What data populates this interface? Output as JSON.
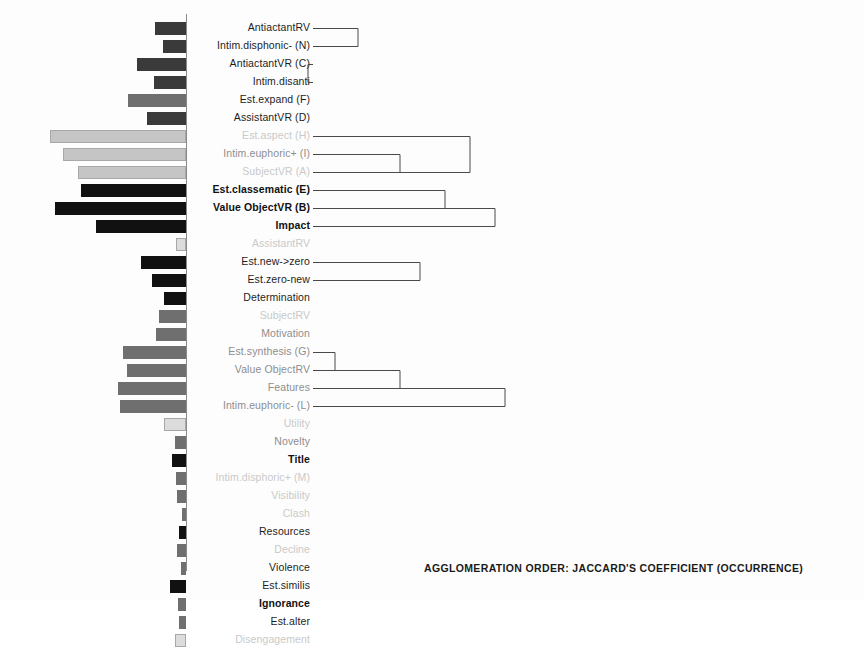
{
  "figure": {
    "caption": "AGGLOMERATION ORDER: JACCARD'S COEFFICIENT (OCCURRENCE)",
    "axis_x": 186,
    "row_height": 18,
    "first_row_y": 20,
    "label_right_x": 310,
    "colors": {
      "bar_dark": "#3a3a3a",
      "bar_black": "#111111",
      "bar_mid": "#6f6f6f",
      "bar_light": "#c5c5c5",
      "bar_pale": "#dcdcdc",
      "axis": "#8a8a8a",
      "dendrogram_line": "#4a4a4a",
      "label_dark": "#1d1d1d",
      "label_mid": "#8e8e8e",
      "label_faint": "#c9c9c9",
      "background": "#fdfdfd"
    }
  },
  "chart_data": {
    "type": "bar",
    "title": "AGGLOMERATION ORDER: JACCARD'S COEFFICIENT (OCCURRENCE)",
    "xlabel": "",
    "ylabel": "",
    "orientation": "horizontal-left",
    "note": "Horizontal bars extend leftward from a vertical axis; paired with a right-hand dendrogram of agglomeration order. Values are bar lengths in pixels measured from the axis.",
    "grid": false,
    "legend": "none",
    "categories": [
      "AntiactantRV",
      "Intim.disphoric- (N)",
      "AntiactantVR (C)",
      "Intim.disanti",
      "Est.expand (F)",
      "AssistantVR (D)",
      "Est.aspect (H)",
      "Intim.euphoric+ (I)",
      "SubjectVR (A)",
      "Est.classematic (E)",
      "Value ObjectVR (B)",
      "Impact",
      "AssistantRV",
      "Est.new->zero",
      "Est.zero-new",
      "Determination",
      "SubjectRV",
      "Motivation",
      "Est.synthesis (G)",
      "Value ObjectRV",
      "Features",
      "Intim.euphoric- (L)",
      "Utility",
      "Novelty",
      "Title",
      "Intim.disphoric+ (M)",
      "Visibility",
      "Clash",
      "Resources",
      "Decline",
      "Violence",
      "Est.similis",
      "Ignorance",
      "Est.alter",
      "Disengagement"
    ],
    "values": [
      31,
      23,
      49,
      32,
      58,
      39,
      136,
      123,
      108,
      105,
      131,
      90,
      10,
      45,
      34,
      22,
      27,
      30,
      63,
      59,
      68,
      66,
      22,
      11,
      14,
      10,
      9,
      4,
      7,
      9,
      5,
      16,
      8,
      7,
      11
    ],
    "bar_styles": [
      "dark",
      "dark",
      "dark",
      "dark",
      "mid",
      "dark",
      "light",
      "light",
      "light",
      "black",
      "black",
      "black",
      "pale",
      "black",
      "black",
      "black",
      "mid",
      "mid",
      "mid",
      "mid",
      "mid",
      "mid",
      "pale",
      "mid",
      "black",
      "mid",
      "mid",
      "mid",
      "black",
      "mid",
      "mid",
      "black",
      "mid",
      "mid",
      "pale"
    ]
  },
  "labels": [
    {
      "text": "AntiactantRV",
      "style": "dark"
    },
    {
      "text": "Intim.disphonic- (N)",
      "style": "dark"
    },
    {
      "text": "AntiactantVR (C)",
      "style": "dark"
    },
    {
      "text": "Intim.disanti",
      "style": "dark"
    },
    {
      "text": "Est.expand (F)",
      "style": "dark"
    },
    {
      "text": "AssistantVR (D)",
      "style": "dark"
    },
    {
      "text": "Est.aspect (H)",
      "style": "faint"
    },
    {
      "text": "Intim.euphoric+ (I)",
      "style": "mid"
    },
    {
      "text": "SubjectVR (A)",
      "style": "faint"
    },
    {
      "text": "Est.classematic (E)",
      "style": "bold"
    },
    {
      "text": "Value ObjectVR (B)",
      "style": "bold"
    },
    {
      "text": "Impact",
      "style": "bold"
    },
    {
      "text": "AssistantRV",
      "style": "faint"
    },
    {
      "text": "Est.new->zero",
      "style": "dark"
    },
    {
      "text": "Est.zero-new",
      "style": "dark"
    },
    {
      "text": "Determination",
      "style": "dark"
    },
    {
      "text": "SubjectRV",
      "style": "faint"
    },
    {
      "text": "Motivation",
      "style": "mid"
    },
    {
      "text": "Est.synthesis (G)",
      "style": "mid"
    },
    {
      "text": "Value ObjectRV",
      "style": "mid"
    },
    {
      "text": "Features",
      "style": "mid"
    },
    {
      "text": "Intim.euphoric- (L)",
      "style": "mid"
    },
    {
      "text": "Utility",
      "style": "faint"
    },
    {
      "text": "Novelty",
      "style": "mid"
    },
    {
      "text": "Title",
      "style": "bold"
    },
    {
      "text": "Intim.disphoric+ (M)",
      "style": "faint"
    },
    {
      "text": "Visibility",
      "style": "faint"
    },
    {
      "text": "Clash",
      "style": "faint"
    },
    {
      "text": "Resources",
      "style": "dark"
    },
    {
      "text": "Decline",
      "style": "faint"
    },
    {
      "text": "Violence",
      "style": "dark"
    },
    {
      "text": "Est.similis",
      "style": "dark"
    },
    {
      "text": "Ignorance",
      "style": "bold"
    },
    {
      "text": "Est.alter",
      "style": "dark"
    },
    {
      "text": "Disengagement",
      "style": "faint"
    }
  ],
  "dendrogram": {
    "start_x": 313,
    "links": [
      {
        "rows": [
          0,
          1
        ],
        "x": 358,
        "name": "link-antiactantrv-intimdisphonic"
      },
      {
        "rows": [
          2,
          3
        ],
        "x": 308,
        "name": "link-antiactantvr-intimdisanti"
      },
      {
        "rows": [
          6,
          8
        ],
        "x": 470,
        "name": "link-estaspect-subjectvr"
      },
      {
        "rows": [
          7,
          8
        ],
        "x": 400,
        "name": "link-intimeuphoric-subjectvr"
      },
      {
        "rows": [
          9,
          10
        ],
        "x": 445,
        "name": "link-estclassematic-valueobjectvr"
      },
      {
        "rows": [
          10,
          11
        ],
        "x": 495,
        "name": "link-valueobjectvr-impact"
      },
      {
        "rows": [
          13,
          14
        ],
        "x": 420,
        "name": "link-estnewzero-estzeronew"
      },
      {
        "rows": [
          18,
          19
        ],
        "x": 335,
        "name": "link-estsynthesis-valueobjectrv"
      },
      {
        "rows": [
          19,
          20
        ],
        "x": 400,
        "name": "link-valueobjectrv-features"
      },
      {
        "rows": [
          20,
          21
        ],
        "x": 505,
        "name": "link-features-intimeuphoric"
      }
    ]
  }
}
